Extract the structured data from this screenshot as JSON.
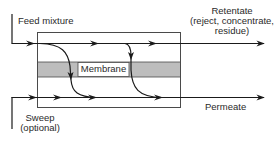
{
  "diagram": {
    "labels": {
      "feed": "Feed mixture",
      "retentate_line1": "Retentate",
      "retentate_line2": "(reject, concentrate,",
      "retentate_line3": "residue)",
      "membrane": "Membrane",
      "sweep_line1": "Sweep",
      "sweep_line2": "(optional)",
      "permeate": "Permeate"
    },
    "colors": {
      "line": "#1a1a1a",
      "membrane_fill": "#bdbdbd",
      "box_stroke": "#4a4a4a"
    },
    "nodes": [
      "Feed mixture",
      "Membrane module",
      "Retentate",
      "Sweep (optional)",
      "Permeate"
    ],
    "edges": [
      {
        "from": "Feed mixture",
        "to": "Retentate",
        "side": "feed/retentate side"
      },
      {
        "from": "Feed mixture",
        "to": "Permeate",
        "via": "Membrane"
      },
      {
        "from": "Sweep (optional)",
        "to": "Permeate",
        "side": "permeate side"
      }
    ]
  }
}
